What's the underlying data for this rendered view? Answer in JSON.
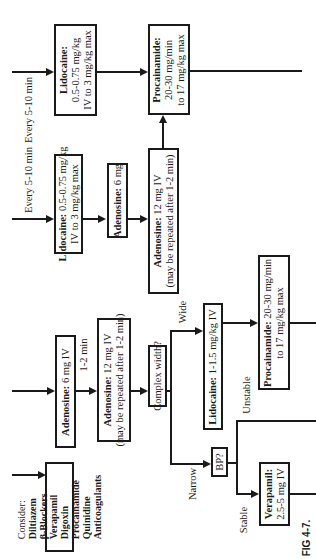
{
  "figure": {
    "caption": "FIG 4-7.",
    "orientation": "rotated 90° counter-clockwise"
  },
  "consider": {
    "title": "Consider:",
    "items": [
      "Diltiazem",
      "β-Blockers",
      "Verapamil",
      "Digoxin",
      "Procainamide",
      "Quinidine",
      "Anticoagulants"
    ]
  },
  "path1": {
    "adenosine_6": {
      "drug": "Adenosine:",
      "dose": "6 mg  IV"
    },
    "interval": "1-2 min",
    "adenosine_12": {
      "drug": "Adenosine:",
      "dose": "12 mg IV",
      "note": "(may be repeated after 1-2 min)"
    },
    "complex_width": "Complex width?",
    "wide_label": "Wide",
    "narrow_label": "Narrow",
    "lidocaine_wide": {
      "drug": "Lidocaine:",
      "dose": "1-1.5 mg/kg IV"
    },
    "procainamide_wide": {
      "drug": "Procainamide:",
      "dose": "20-30 mg/min",
      "max": "to 17 mg/kg max"
    },
    "bp": "BP?",
    "unstable_label": "Unstable",
    "stable_label": "Stable",
    "verapamil": {
      "drug": "Verapamil:",
      "dose": "2.5-5 mg IV"
    }
  },
  "path2": {
    "interval": "Every 5-10 min",
    "lidocaine": {
      "drug": "Lidocaine:",
      "dose": "0.5-0.75 mg/kg",
      "max": "IV to 3 mg/kg max"
    },
    "adenosine_6": {
      "drug": "Adenosine:",
      "dose": "6 mg"
    },
    "adenosine_12": {
      "drug": "Adenosine:",
      "dose": "12 mg IV",
      "note": "(may be repeated after 1-2 min)"
    }
  },
  "path3": {
    "interval": "Every 5-10 min",
    "lidocaine": {
      "drug": "Lidocaine:",
      "dose": "0.5-0.75 mg/kg",
      "max": "IV to 3 mg/kg max"
    },
    "procainamide": {
      "drug": "Procainamide:",
      "dose": "20-30 mg/min",
      "max": "to 17 mg/kg max"
    }
  }
}
